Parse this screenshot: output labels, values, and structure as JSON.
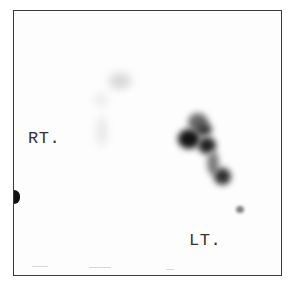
{
  "image": {
    "type": "scintigraphy-scan",
    "colors": {
      "frame": "#3a3a3a",
      "background": "#fdfdfd",
      "uptake_dark": "#1a1a1a",
      "uptake_mid": "#555555",
      "uptake_faint": "#cfcfcf"
    }
  },
  "labels": {
    "right_side": "RT.",
    "left_side": "LT."
  }
}
